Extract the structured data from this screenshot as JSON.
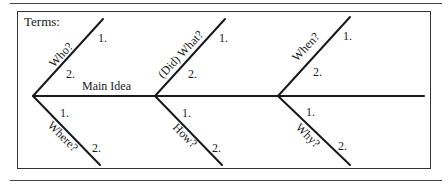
{
  "diagram": {
    "type": "fishbone",
    "title": "Terms:",
    "spine_label": "Main Idea",
    "branches": [
      {
        "label": "Who?",
        "position": "upper",
        "group": 1,
        "slots": [
          "1.",
          "2."
        ]
      },
      {
        "label": "Where?",
        "position": "lower",
        "group": 1,
        "slots": [
          "1.",
          "2."
        ]
      },
      {
        "label": "(Did) What?",
        "position": "upper",
        "group": 2,
        "slots": [
          "1.",
          "2."
        ]
      },
      {
        "label": "How?",
        "position": "lower",
        "group": 2,
        "slots": [
          "1.",
          "2."
        ]
      },
      {
        "label": "When?",
        "position": "upper",
        "group": 3,
        "slots": [
          "1.",
          "2."
        ]
      },
      {
        "label": "Why?",
        "position": "lower",
        "group": 3,
        "slots": [
          "1.",
          "2."
        ]
      }
    ],
    "colors": {
      "line": "#1a1a1a",
      "border": "#333333",
      "background": "#ffffff"
    }
  }
}
